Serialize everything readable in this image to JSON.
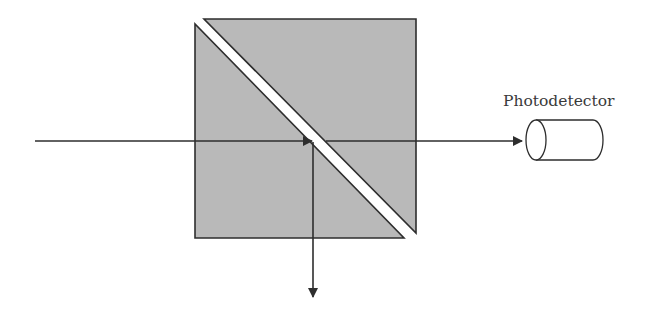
{
  "diagram": {
    "type": "optical-setup",
    "title": "",
    "colors": {
      "prism_fill": "#b9b9b9",
      "stroke": "#2e2e2e",
      "gap": "#ffffff",
      "background": "#ffffff"
    },
    "components": {
      "beam_splitter": {
        "label": "",
        "shape": "cube beam splitter with diagonal interface"
      },
      "photodetector": {
        "label": "Photodetector"
      }
    },
    "beams": [
      {
        "id": "input-beam",
        "direction": "right",
        "from": "left",
        "to": "beam-splitter"
      },
      {
        "id": "transmitted-beam",
        "direction": "right",
        "from": "beam-splitter",
        "to": "photodetector"
      },
      {
        "id": "reflected-beam",
        "direction": "down",
        "from": "beam-splitter",
        "to": "bottom"
      }
    ]
  }
}
